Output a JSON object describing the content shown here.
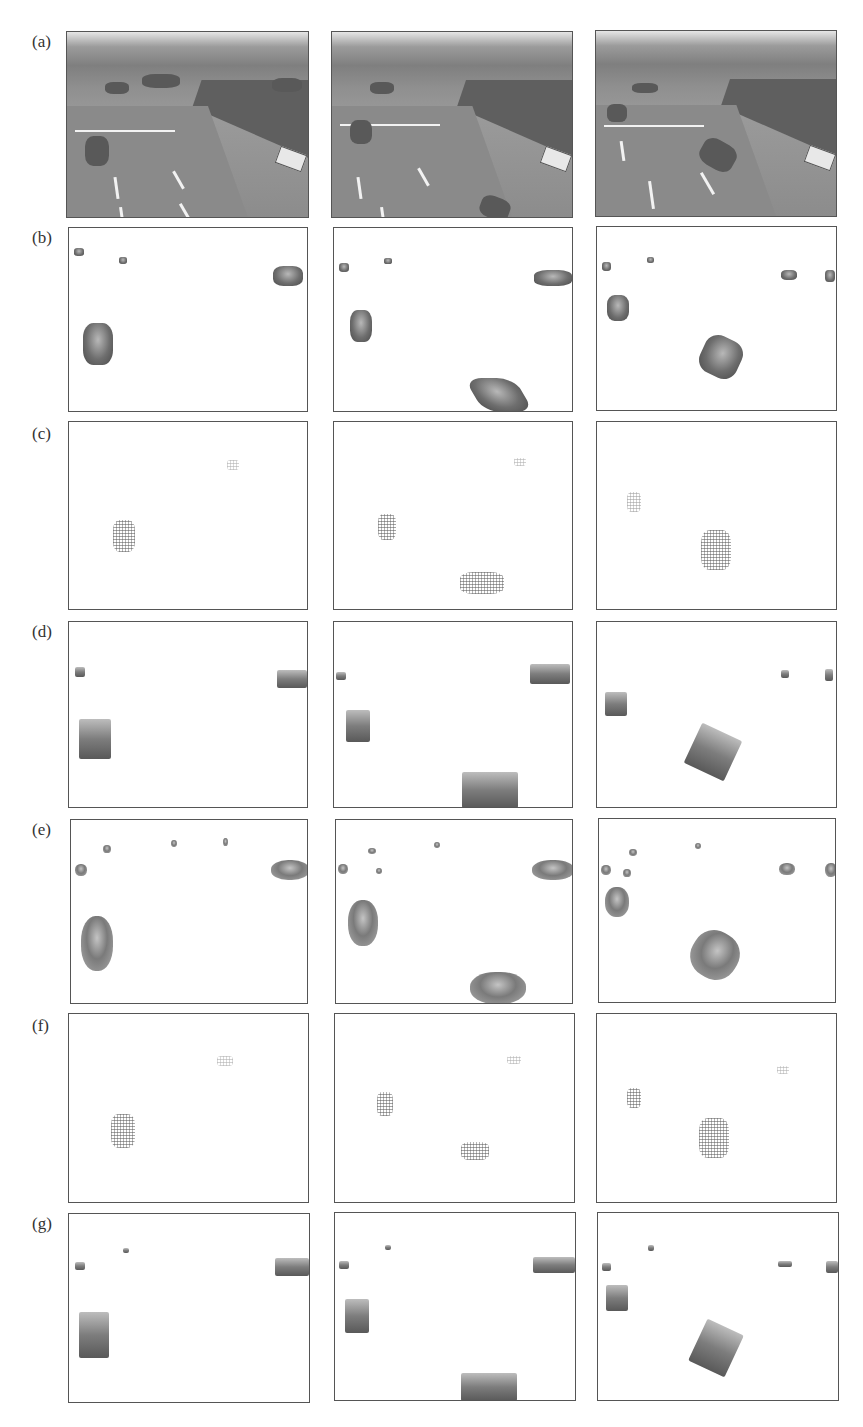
{
  "figure": {
    "rows": [
      {
        "label": "(a)",
        "type": "scene"
      },
      {
        "label": "(b)",
        "type": "dark"
      },
      {
        "label": "(c)",
        "type": "dots"
      },
      {
        "label": "(d)",
        "type": "blocky"
      },
      {
        "label": "(e)",
        "type": "soft"
      },
      {
        "label": "(f)",
        "type": "dots"
      },
      {
        "label": "(g)",
        "type": "blocky"
      }
    ],
    "columns": 3,
    "colors": {
      "border": "#555555",
      "background": "#ffffff",
      "foreground_gray": "#6e6e6e"
    }
  }
}
